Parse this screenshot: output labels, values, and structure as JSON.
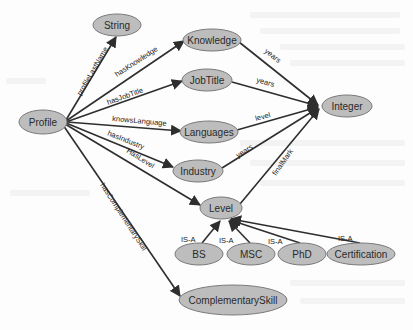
{
  "diagram": {
    "type": "ontology-graph",
    "nodes": {
      "string": "String",
      "knowledge": "Knowledge",
      "jobtitle": "JobTitle",
      "profile": "Profile",
      "languages": "Languages",
      "integer": "Integer",
      "industry": "Industry",
      "level": "Level",
      "bs": "BS",
      "msc": "MSC",
      "phd": "PhD",
      "certification": "Certification",
      "complementaryskill": "ComplementarySkill"
    },
    "edges": {
      "profile_string": "profileLastName",
      "profile_knowledge": "hasKnowledge",
      "profile_jobtitle": "hasJobTitle",
      "profile_languages": "knowsLanguage",
      "profile_industry": "hasIndustry",
      "profile_level": "HasLevel",
      "profile_complementaryskill": "hasComplementarySkill",
      "knowledge_integer": "years",
      "jobtitle_integer": "years",
      "languages_integer": "level",
      "industry_integer": "years",
      "level_integer": "finalMark",
      "bs_level": "IS-A",
      "msc_level": "IS-A",
      "phd_level": "IS-A",
      "certification_level": "IS-A"
    },
    "colors": {
      "node_fill": "#bdbdbd",
      "node_stroke": "#7a7a7a",
      "edge": "#2e2e2e",
      "text": "#2a2a2a"
    }
  }
}
